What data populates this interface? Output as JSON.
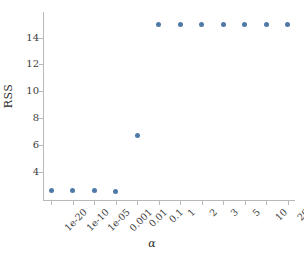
{
  "chart_data": {
    "type": "scatter",
    "title": "",
    "xlabel": "α",
    "ylabel": "RSS",
    "categories": [
      "1e-20",
      "1e-10",
      "1e-05",
      "0.001",
      "0.01",
      "0.1",
      "1",
      "2",
      "3",
      "5",
      "10",
      "20"
    ],
    "values": [
      2.6,
      2.6,
      2.6,
      2.55,
      6.7,
      15.0,
      15.0,
      15.0,
      15.0,
      15.0,
      15.0,
      15.0
    ],
    "yticks": [
      "4",
      "6",
      "8",
      "10",
      "12",
      "14"
    ],
    "ytick_values": [
      4,
      6,
      8,
      10,
      12,
      14
    ],
    "ylim": [
      1.9,
      15.9
    ],
    "grid": false,
    "legend": "none",
    "marker_color": "#4f7aa8",
    "axis_color": "#b8b8b8"
  },
  "axes": {
    "y_label": "RSS",
    "x_label": "α"
  }
}
